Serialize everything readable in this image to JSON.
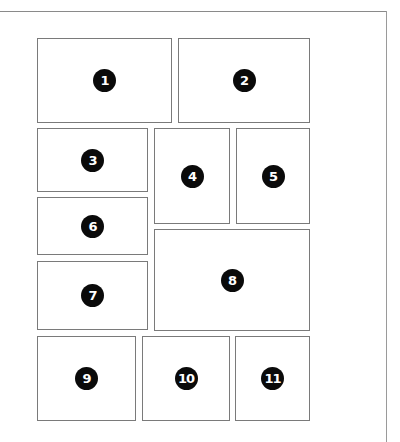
{
  "diagram": {
    "type": "page-layout-numbered-panels",
    "frame": {
      "line_color": "#8a8a8a"
    },
    "badge_style": {
      "fill": "#0a0a0a",
      "text_color": "#ffffff"
    },
    "panels": [
      {
        "id": 1,
        "label": "1",
        "x": 37,
        "y": 38,
        "w": 135,
        "h": 85
      },
      {
        "id": 2,
        "label": "2",
        "x": 178,
        "y": 38,
        "w": 132,
        "h": 85
      },
      {
        "id": 3,
        "label": "3",
        "x": 37,
        "y": 128,
        "w": 111,
        "h": 64
      },
      {
        "id": 4,
        "label": "4",
        "x": 154,
        "y": 128,
        "w": 76,
        "h": 96
      },
      {
        "id": 5,
        "label": "5",
        "x": 236,
        "y": 128,
        "w": 74,
        "h": 96
      },
      {
        "id": 6,
        "label": "6",
        "x": 37,
        "y": 197,
        "w": 111,
        "h": 58
      },
      {
        "id": 7,
        "label": "7",
        "x": 37,
        "y": 261,
        "w": 111,
        "h": 69
      },
      {
        "id": 8,
        "label": "8",
        "x": 154,
        "y": 229,
        "w": 156,
        "h": 102
      },
      {
        "id": 9,
        "label": "9",
        "x": 37,
        "y": 336,
        "w": 99,
        "h": 85
      },
      {
        "id": 10,
        "label": "10",
        "x": 142,
        "y": 336,
        "w": 88,
        "h": 85
      },
      {
        "id": 11,
        "label": "11",
        "x": 235,
        "y": 336,
        "w": 75,
        "h": 85
      }
    ]
  }
}
